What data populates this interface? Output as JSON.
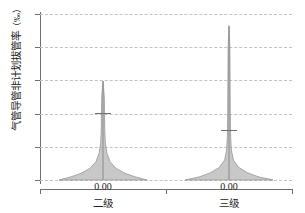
{
  "chart_data": {
    "type": "violin",
    "title": "",
    "xlabel": "",
    "ylabel": "气管导管非计划拔管率",
    "yunit": "（‰）",
    "ylim": [
      0,
      5
    ],
    "ytick_labels": [
      "0",
      "1",
      "2",
      "3",
      "4",
      "5"
    ],
    "ytick_values": [
      0,
      1,
      2,
      3,
      4,
      5
    ],
    "grid": "horizontal-dashed",
    "legend": "none",
    "categories": [
      "二级",
      "三级"
    ],
    "series": [
      {
        "name": "二级",
        "data_label": "0.00",
        "median": 0.0,
        "mean_marker": 2.02,
        "min": 0.0,
        "max": 2.98,
        "density_profile": [
          {
            "y": 0.0,
            "w": 1.0
          },
          {
            "y": 0.1,
            "w": 0.72
          },
          {
            "y": 0.2,
            "w": 0.5
          },
          {
            "y": 0.35,
            "w": 0.3
          },
          {
            "y": 0.55,
            "w": 0.16
          },
          {
            "y": 0.8,
            "w": 0.09
          },
          {
            "y": 1.1,
            "w": 0.055
          },
          {
            "y": 1.5,
            "w": 0.04
          },
          {
            "y": 2.0,
            "w": 0.035
          },
          {
            "y": 2.5,
            "w": 0.03
          },
          {
            "y": 2.98,
            "w": 0.0
          }
        ]
      },
      {
        "name": "三级",
        "data_label": "0.00",
        "median": 0.0,
        "mean_marker": 1.52,
        "min": 0.0,
        "max": 4.65,
        "density_profile": [
          {
            "y": 0.0,
            "w": 1.0
          },
          {
            "y": 0.1,
            "w": 0.66
          },
          {
            "y": 0.22,
            "w": 0.42
          },
          {
            "y": 0.38,
            "w": 0.22
          },
          {
            "y": 0.6,
            "w": 0.1
          },
          {
            "y": 0.9,
            "w": 0.055
          },
          {
            "y": 1.3,
            "w": 0.038
          },
          {
            "y": 2.0,
            "w": 0.03
          },
          {
            "y": 3.0,
            "w": 0.025
          },
          {
            "y": 4.0,
            "w": 0.02
          },
          {
            "y": 4.65,
            "w": 0.0
          }
        ]
      }
    ],
    "colors": {
      "violin_fill": "#b6b6b6",
      "violin_edge": "#8c8c8c",
      "grid": "#c3c3c3",
      "axis": "#6f6f6f",
      "text": "#1e1e1e"
    }
  }
}
